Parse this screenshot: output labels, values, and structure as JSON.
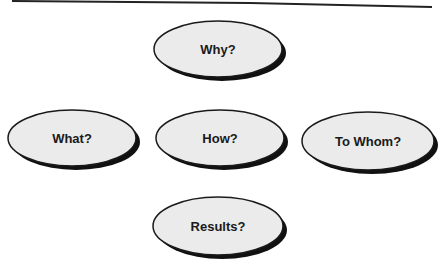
{
  "diagram": {
    "nodes": [
      {
        "id": "why",
        "label": "Why?",
        "cx": 218,
        "cy": 49,
        "rx": 64,
        "ry": 28
      },
      {
        "id": "what",
        "label": "What?",
        "cx": 72,
        "cy": 138,
        "rx": 64,
        "ry": 28
      },
      {
        "id": "how",
        "label": "How?",
        "cx": 220,
        "cy": 138,
        "rx": 64,
        "ry": 28
      },
      {
        "id": "to-whom",
        "label": "To Whom?",
        "cx": 368,
        "cy": 141,
        "rx": 66,
        "ry": 29
      },
      {
        "id": "results",
        "label": "Results?",
        "cx": 218,
        "cy": 226,
        "rx": 65,
        "ry": 29
      }
    ],
    "colors": {
      "fill": "#ebebeb",
      "stroke": "#1a1a1a",
      "shadow": "#111111"
    }
  }
}
